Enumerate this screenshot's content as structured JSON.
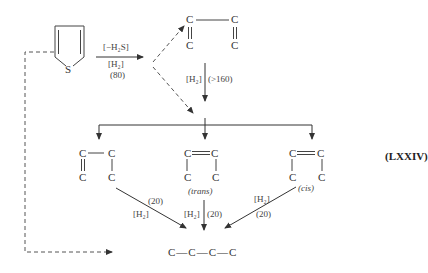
{
  "diagram": {
    "type": "reaction-scheme",
    "reference_label": "(LXXIV)",
    "reactant": {
      "name": "thiophene",
      "heteroatom": "S"
    },
    "step1": {
      "reagent_top": "[−H₂S]",
      "reagent_mid": "[H₂]",
      "condition": "(80)"
    },
    "butadiene": {
      "atoms": [
        "C",
        "C",
        "C",
        "C"
      ]
    },
    "step2": {
      "reagent": "[H₂]",
      "condition": "(>160)"
    },
    "isomers": [
      {
        "id": "1-butene",
        "atoms": [
          "C",
          "C",
          "C",
          "C"
        ],
        "label": ""
      },
      {
        "id": "trans-2-butene",
        "atoms": [
          "C",
          "C",
          "C",
          "C"
        ],
        "label": "(trans)"
      },
      {
        "id": "cis-2-butene",
        "atoms": [
          "C",
          "C",
          "C",
          "C"
        ],
        "label": "(cis)"
      }
    ],
    "hydrogenation": [
      {
        "from": "1-butene",
        "reagent": "[H₂]",
        "condition": "(20)"
      },
      {
        "from": "trans-2-butene",
        "reagent": "[H₂]",
        "condition": "(20)"
      },
      {
        "from": "cis-2-butene",
        "reagent": "[H₂]",
        "condition": "(20)"
      }
    ],
    "product": {
      "formula": "C—C—C—C"
    }
  }
}
